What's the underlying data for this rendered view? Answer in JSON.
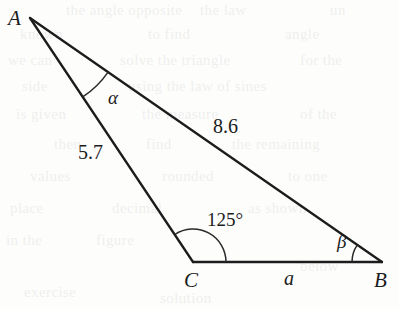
{
  "figure": {
    "type": "geometry-diagram",
    "shape": "triangle",
    "background_color": "#fdfdfc",
    "stroke_color": "#1c1c1c"
  },
  "vertices": {
    "a": {
      "label": "A",
      "x": 30,
      "y": 18,
      "label_x": 8,
      "label_y": 8
    },
    "c": {
      "label": "C",
      "x": 193,
      "y": 262,
      "label_x": 184,
      "label_y": 270
    },
    "b": {
      "label": "B",
      "x": 382,
      "y": 262,
      "label_x": 374,
      "label_y": 270
    }
  },
  "sides": [
    {
      "name": "side-ac",
      "label": "5.7",
      "from": "A",
      "to": "C",
      "label_x": 78,
      "label_y": 142
    },
    {
      "name": "side-ab",
      "label": "8.6",
      "from": "A",
      "to": "B",
      "label_x": 213,
      "label_y": 116
    },
    {
      "name": "side-cb",
      "label": "a",
      "from": "C",
      "to": "B",
      "label_x": 284,
      "label_y": 268
    }
  ],
  "angles": [
    {
      "name": "angle-a",
      "label": "α",
      "at": "A",
      "arc_radius": 95,
      "label_x": 108,
      "label_y": 88
    },
    {
      "name": "angle-c",
      "label": "125°",
      "at": "C",
      "arc_radius": 33,
      "label_x": 207,
      "label_y": 210
    },
    {
      "name": "angle-b",
      "label": "β",
      "at": "B",
      "arc_radius": 30,
      "label_x": 337,
      "label_y": 232
    }
  ],
  "bleed_text": [
    {
      "text": "the angle opposite",
      "x": 66,
      "y": 2
    },
    {
      "text": "the law",
      "x": 200,
      "y": 2
    },
    {
      "text": "un",
      "x": 330,
      "y": 2
    },
    {
      "text": "known",
      "x": 20,
      "y": 26
    },
    {
      "text": "to find",
      "x": 148,
      "y": 26
    },
    {
      "text": "angle",
      "x": 285,
      "y": 26
    },
    {
      "text": "we can",
      "x": 8,
      "y": 52
    },
    {
      "text": "solve the triangle",
      "x": 120,
      "y": 52
    },
    {
      "text": "for the",
      "x": 300,
      "y": 52
    },
    {
      "text": "side",
      "x": 22,
      "y": 78
    },
    {
      "text": "using the law of sines",
      "x": 128,
      "y": 78
    },
    {
      "text": "is given",
      "x": 16,
      "y": 106
    },
    {
      "text": "the measure",
      "x": 142,
      "y": 106
    },
    {
      "text": "of the",
      "x": 300,
      "y": 106
    },
    {
      "text": "then",
      "x": 54,
      "y": 136
    },
    {
      "text": "find",
      "x": 146,
      "y": 136
    },
    {
      "text": "the remaining",
      "x": 232,
      "y": 136
    },
    {
      "text": "values",
      "x": 30,
      "y": 168
    },
    {
      "text": "rounded",
      "x": 162,
      "y": 168
    },
    {
      "text": "to one",
      "x": 288,
      "y": 168
    },
    {
      "text": "place",
      "x": 10,
      "y": 200
    },
    {
      "text": "decimal",
      "x": 112,
      "y": 200
    },
    {
      "text": "as shown",
      "x": 248,
      "y": 200
    },
    {
      "text": "in the",
      "x": 6,
      "y": 232
    },
    {
      "text": "figure",
      "x": 96,
      "y": 232
    },
    {
      "text": "below",
      "x": 300,
      "y": 258
    },
    {
      "text": "exercise",
      "x": 24,
      "y": 284
    },
    {
      "text": "solution",
      "x": 160,
      "y": 290
    }
  ]
}
